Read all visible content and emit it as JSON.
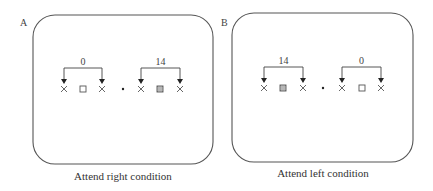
{
  "figure": {
    "panels": [
      {
        "id": "A",
        "letter": "A",
        "letter_pos": [
          20,
          26
        ],
        "frame": {
          "x": 33,
          "y": 15,
          "w": 180,
          "h": 149,
          "r": 22
        },
        "caption": "Attend right condition",
        "caption_pos": [
          123,
          180
        ],
        "fixation": {
          "x": 123,
          "y": 89
        },
        "groups": [
          {
            "label": "0",
            "side": "left",
            "x_left": 64,
            "x_right": 102,
            "center_symbol": "open-square",
            "center_x": 83
          },
          {
            "label": "14",
            "side": "right",
            "x_left": 141,
            "x_right": 180,
            "center_symbol": "hatched-square",
            "center_x": 160
          }
        ]
      },
      {
        "id": "B",
        "letter": "B",
        "letter_pos": [
          221,
          26
        ],
        "frame": {
          "x": 232,
          "y": 13,
          "w": 181,
          "h": 149,
          "r": 22
        },
        "caption": "Attend left condition",
        "caption_pos": [
          323,
          177
        ],
        "fixation": {
          "x": 323,
          "y": 88
        },
        "groups": [
          {
            "label": "14",
            "side": "left",
            "x_left": 264,
            "x_right": 303,
            "center_symbol": "hatched-square",
            "center_x": 283
          },
          {
            "label": "0",
            "side": "right",
            "x_left": 342,
            "x_right": 381,
            "center_symbol": "open-square",
            "center_x": 362
          }
        ]
      }
    ],
    "symbols": {
      "flanker": "x-mark",
      "fixation": "dot"
    },
    "bracket": {
      "rise": 21,
      "arrow_len": 5
    }
  }
}
